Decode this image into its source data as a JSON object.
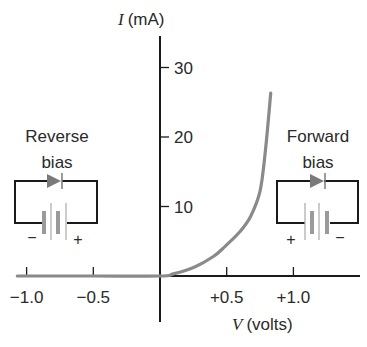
{
  "chart_data": {
    "type": "line",
    "title": "",
    "xlabel_var": "V",
    "xlabel_unit": "(volts)",
    "ylabel_var": "I",
    "ylabel_unit": "(mA)",
    "xlim": [
      -1.1,
      1.5
    ],
    "ylim": [
      0,
      32
    ],
    "x_ticks": [
      -1.0,
      -0.5,
      0.5,
      1.0
    ],
    "x_tick_labels": [
      "−1.0",
      "−0.5",
      "+0.5",
      "+1.0"
    ],
    "y_ticks": [
      10,
      20,
      30
    ],
    "y_tick_labels": [
      "10",
      "20",
      "30"
    ],
    "grid": false,
    "series": [
      {
        "name": "Diode I-V characteristic",
        "color": "#8a8a8a",
        "x": [
          -1.07,
          -0.5,
          0.0,
          0.1,
          0.26,
          0.4,
          0.49,
          0.6,
          0.68,
          0.75,
          0.79,
          0.83
        ],
        "y": [
          0,
          0,
          0,
          0.3,
          1.3,
          2.8,
          4.3,
          6.4,
          8.6,
          12.2,
          18.0,
          26.3
        ]
      }
    ],
    "annotations": [
      {
        "text": "Reverse bias",
        "region": "left"
      },
      {
        "text": "Forward bias",
        "region": "right"
      }
    ]
  },
  "labels": {
    "reverse_line1": "Reverse",
    "reverse_line2": "bias",
    "forward_line1": "Forward",
    "forward_line2": "bias",
    "minus": "−",
    "plus": "+"
  },
  "colors": {
    "axis": "#1a1a1a",
    "curve": "#8a8a8a",
    "diode": "#7a7a7a",
    "battery_thick": "#9a9a9a",
    "battery_thin": "#b0b0b0"
  }
}
